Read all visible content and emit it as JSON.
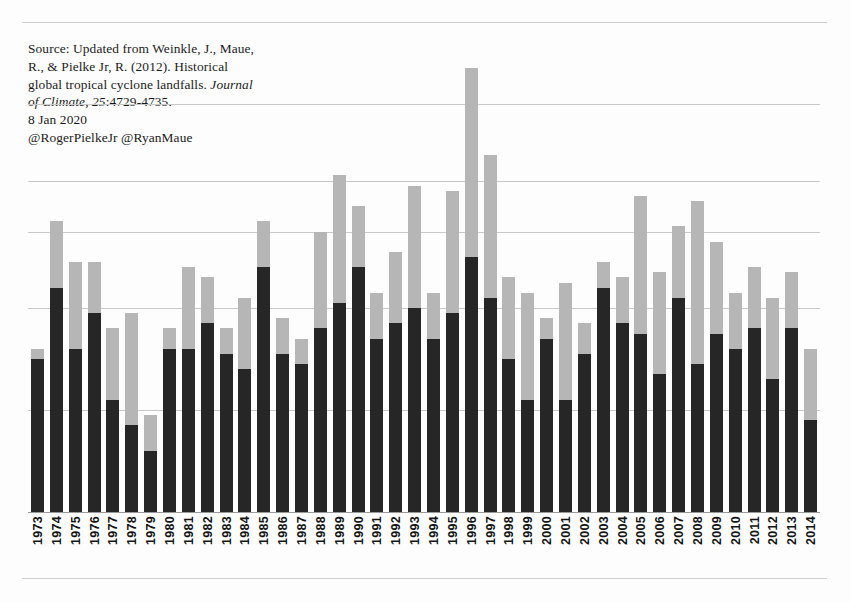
{
  "document": {
    "source_note_lines": [
      "Source: Updated from Weinkle, J., Maue,",
      "R., & Pielke Jr, R. (2012). Historical",
      "global tropical cyclone landfalls. ",
      "Journal of Climate, 25",
      ":4729-4735.",
      "8 Jan 2020",
      "@RogerPielkeJr @RyanMaue"
    ],
    "source_line1": "Source: Updated from Weinkle, J., Maue,",
    "source_line2": "R., & Pielke Jr, R. (2012). Historical",
    "source_line3_plain": "global tropical cyclone landfalls. ",
    "source_line3_italic": "Journal",
    "source_line4_italic": "of Climate, 25",
    "source_line4_plain": ":4729-4735.",
    "source_date": "8 Jan 2020",
    "source_handles": "@RogerPielkeJr @RyanMaue"
  },
  "colors": {
    "all_storms": "#262626",
    "major_storms": "#b6b6b6",
    "gridline": "#c9c9c9",
    "axis": "#9a9a9a",
    "text": "#141414",
    "background": "#fdfdfd"
  },
  "chart_data": {
    "type": "bar",
    "title": "",
    "subtitle": "",
    "xlabel": "",
    "ylabel": "",
    "stacked": true,
    "grid": true,
    "grid_axis": "y",
    "legend_position": "none",
    "ylim": [
      0,
      80
    ],
    "yticks": [
      0,
      20,
      40,
      60,
      70,
      80
    ],
    "gridline_values": [
      20,
      40,
      55,
      65,
      80
    ],
    "categories": [
      "1973",
      "1974",
      "1975",
      "1976",
      "1977",
      "1978",
      "1979",
      "1980",
      "1981",
      "1982",
      "1983",
      "1984",
      "1985",
      "1986",
      "1987",
      "1988",
      "1989",
      "1990",
      "1991",
      "1992",
      "1993",
      "1994",
      "1995",
      "1996",
      "1997",
      "1998",
      "1999",
      "2000",
      "2001",
      "2002",
      "2003",
      "2004",
      "2005",
      "2006",
      "2007",
      "2008",
      "2009",
      "2010",
      "2011",
      "2012",
      "2013",
      "2014"
    ],
    "series": [
      {
        "name": "All tropical cyclone landfalls",
        "color": "#262626",
        "values": [
          30,
          44,
          32,
          39,
          22,
          17,
          12,
          32,
          32,
          37,
          31,
          28,
          48,
          31,
          29,
          36,
          41,
          48,
          34,
          37,
          40,
          34,
          39,
          50,
          42,
          30,
          22,
          34,
          22,
          31,
          44,
          37,
          35,
          27,
          42,
          29,
          35,
          32,
          36,
          26,
          36,
          18
        ]
      },
      {
        "name": "Major tropical cyclone landfalls (Cat 3+)",
        "color": "#b6b6b6",
        "values": [
          2,
          13,
          17,
          10,
          14,
          22,
          7,
          4,
          16,
          9,
          5,
          14,
          9,
          7,
          5,
          19,
          25,
          12,
          9,
          14,
          24,
          9,
          24,
          37,
          28,
          16,
          21,
          4,
          23,
          6,
          5,
          9,
          27,
          20,
          14,
          32,
          18,
          11,
          12,
          16,
          11,
          14
        ]
      }
    ],
    "totals": [
      32,
      57,
      49,
      49,
      36,
      39,
      19,
      36,
      48,
      46,
      36,
      42,
      57,
      38,
      34,
      55,
      66,
      60,
      43,
      51,
      64,
      43,
      63,
      78,
      62,
      52,
      43,
      38,
      45,
      37,
      49,
      64,
      62,
      47,
      56,
      74,
      53,
      46,
      48,
      42,
      47,
      32
    ]
  }
}
